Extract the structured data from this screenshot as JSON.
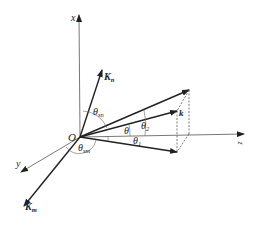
{
  "diagram": {
    "type": "3d-vector-geometry",
    "origin_label": "O",
    "axes": [
      {
        "name": "x",
        "label": "x",
        "direction": "up"
      },
      {
        "name": "y",
        "label": "y",
        "direction": "down-left"
      },
      {
        "name": "z",
        "label": "z",
        "direction": "right"
      }
    ],
    "vectors": [
      {
        "name": "K_n",
        "label": "K",
        "subscript": "n",
        "bold": true
      },
      {
        "name": "K_m",
        "label": "K",
        "subscript": "m",
        "bold": true
      },
      {
        "name": "k",
        "label": "k",
        "bold": true
      }
    ],
    "angles": [
      {
        "label": "θ",
        "subscript": "sn"
      },
      {
        "label": "θ",
        "subscript": "sm"
      },
      {
        "label": "θ",
        "subscript": ""
      },
      {
        "label": "θ",
        "subscript": "1"
      },
      {
        "label": "θ",
        "subscript": "2"
      }
    ],
    "colors": {
      "line": "#222222",
      "axis": "#555555",
      "background": "#ffffff"
    }
  }
}
